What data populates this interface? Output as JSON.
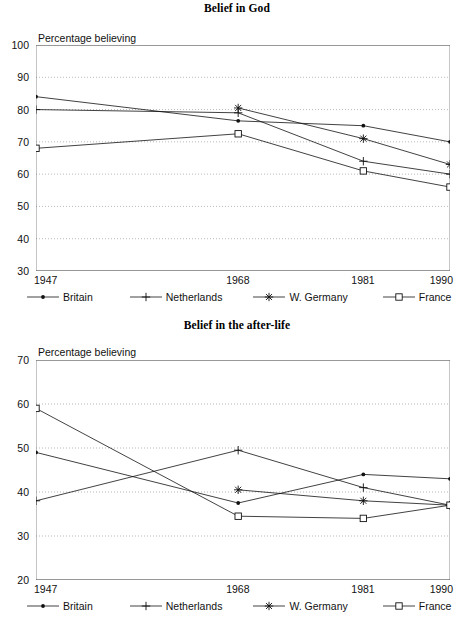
{
  "document": {
    "kind": "two-panel line chart figure"
  },
  "charts": [
    {
      "id": "belief-in-god",
      "title": "Belief in God",
      "axis_caption": "Percentage believing"
    },
    {
      "id": "belief-in-the-after-life",
      "title": "Belief in the after-life",
      "axis_caption": "Percentage believing"
    }
  ],
  "legend": {
    "items": [
      {
        "key": "britain",
        "label": "Britain",
        "marker": "dot-marker"
      },
      {
        "key": "netherlands",
        "label": "Netherlands",
        "marker": "plus-marker"
      },
      {
        "key": "wgermany",
        "label": "W. Germany",
        "marker": "asterisk-marker"
      },
      {
        "key": "france",
        "label": "France",
        "marker": "square-marker"
      }
    ]
  },
  "chart_data": [
    {
      "type": "line",
      "title": "Belief in God",
      "xlabel": "",
      "ylabel": "Percentage believing",
      "x": [
        1947,
        1968,
        1981,
        1990
      ],
      "xtick_labels": [
        "1947",
        "1968",
        "1981",
        "1990"
      ],
      "ytick_labels": [
        "30",
        "40",
        "50",
        "60",
        "70",
        "80",
        "90",
        "100"
      ],
      "yticks": [
        30,
        40,
        50,
        60,
        70,
        80,
        90,
        100
      ],
      "ylim": [
        30,
        100
      ],
      "grid": "horizontal-dotted",
      "legend_position": "below-axis",
      "series": [
        {
          "name": "Britain",
          "marker": "dot",
          "values": [
            84,
            76.5,
            75,
            70
          ]
        },
        {
          "name": "Netherlands",
          "marker": "plus",
          "values": [
            80,
            79,
            64,
            60
          ]
        },
        {
          "name": "W. Germany",
          "marker": "asterisk",
          "values": [
            null,
            80.5,
            71,
            63
          ]
        },
        {
          "name": "France",
          "marker": "square",
          "values": [
            68,
            72.5,
            61,
            56
          ]
        }
      ]
    },
    {
      "type": "line",
      "title": "Belief in the after-life",
      "xlabel": "",
      "ylabel": "Percentage believing",
      "x": [
        1947,
        1968,
        1981,
        1990
      ],
      "xtick_labels": [
        "1947",
        "1968",
        "1981",
        "1990"
      ],
      "ytick_labels": [
        "20",
        "30",
        "40",
        "50",
        "60",
        "70"
      ],
      "yticks": [
        20,
        30,
        40,
        50,
        60,
        70
      ],
      "ylim": [
        20,
        70
      ],
      "grid": "horizontal-dotted",
      "legend_position": "below-axis",
      "series": [
        {
          "name": "Britain",
          "marker": "dot",
          "values": [
            49,
            37.5,
            44,
            43
          ]
        },
        {
          "name": "Netherlands",
          "marker": "plus",
          "values": [
            38,
            49.5,
            41,
            37
          ]
        },
        {
          "name": "W. Germany",
          "marker": "asterisk",
          "values": [
            null,
            40.5,
            38,
            37
          ]
        },
        {
          "name": "France",
          "marker": "square",
          "values": [
            59,
            34.5,
            34,
            37
          ]
        }
      ]
    }
  ]
}
